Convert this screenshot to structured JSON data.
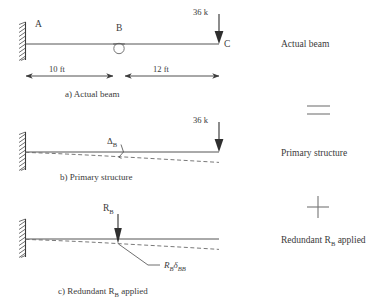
{
  "figure": {
    "title_implicit": "Force method: actual beam decomposition",
    "panels": [
      {
        "id": "a",
        "caption": "a) Actual beam",
        "side_label": "Actual beam",
        "points": [
          "A",
          "B",
          "C"
        ],
        "load_label": "36 k",
        "dimensions": [
          "10 ft",
          "12 ft"
        ],
        "support": "fixed",
        "internal_hinge_at": "B"
      },
      {
        "id": "b",
        "caption": "b) Primary structure",
        "side_label": "Primary structure",
        "load_label": "36 k",
        "deflection_label": "Δ",
        "deflection_sub": "B",
        "support": "fixed"
      },
      {
        "id": "c",
        "caption": "c) Redundant R",
        "caption_sub": "B",
        "caption_tail": " applied",
        "side_label_main": "Redundant R",
        "side_label_sub": "B",
        "side_label_tail": " applied",
        "redundant_label": "R",
        "redundant_sub": "B",
        "deflection_term_main": "R",
        "deflection_term_sub1": "B",
        "deflection_term_delta": "δ",
        "deflection_term_sub2": "BB",
        "support": "fixed"
      }
    ],
    "operators": [
      {
        "symbol": "=",
        "between": "a-b"
      },
      {
        "symbol": "+",
        "between": "b-c"
      }
    ],
    "colors": {
      "beam": "#555555",
      "deflection": "#6a6a6a",
      "text": "#3a3a3a",
      "arrow": "#2f2f2f",
      "background": "#ffffff"
    }
  }
}
